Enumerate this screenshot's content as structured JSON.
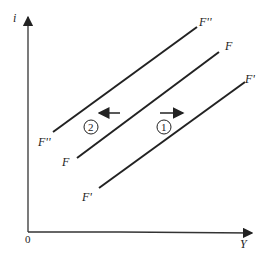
{
  "diagram": {
    "axes": {
      "y_label": "i",
      "x_label": "Y",
      "origin_label": "0"
    },
    "curves": [
      {
        "name": "F''",
        "start_label": "F''",
        "end_label": "F''",
        "x1": 53,
        "y1": 132,
        "x2": 197,
        "y2": 27
      },
      {
        "name": "F",
        "start_label": "F",
        "end_label": "F",
        "x1": 77,
        "y1": 158,
        "x2": 219,
        "y2": 52
      },
      {
        "name": "F'",
        "start_label": "F'",
        "end_label": "F'",
        "x1": 99,
        "y1": 188,
        "x2": 245,
        "y2": 82
      }
    ],
    "shifts": [
      {
        "marker": "1",
        "direction": "right"
      },
      {
        "marker": "2",
        "direction": "left"
      }
    ],
    "colors": {
      "ink": "#222222",
      "background": "#ffffff"
    }
  }
}
